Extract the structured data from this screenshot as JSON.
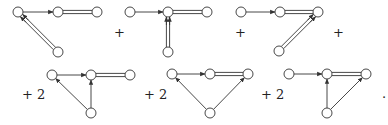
{
  "equation": {
    "operators": {
      "plus": "+",
      "plus_two": "+ 2",
      "terminator": "."
    },
    "diagrams": [
      {
        "id": "d1",
        "row": 1,
        "nodes": [
          [
            18,
            12
          ],
          [
            58,
            12
          ],
          [
            97,
            12
          ],
          [
            58,
            52
          ]
        ],
        "edges": [
          {
            "from": 0,
            "to": 1,
            "type": "arrow"
          },
          {
            "from": 1,
            "to": 2,
            "type": "double"
          },
          {
            "from": 3,
            "to": 0,
            "type": "double-arrow"
          }
        ]
      },
      {
        "id": "d2",
        "row": 1,
        "nodes": [
          [
            130,
            12
          ],
          [
            168,
            12
          ],
          [
            207,
            12
          ],
          [
            168,
            52
          ]
        ],
        "edges": [
          {
            "from": 0,
            "to": 1,
            "type": "arrow"
          },
          {
            "from": 1,
            "to": 2,
            "type": "double"
          },
          {
            "from": 3,
            "to": 1,
            "type": "double-arrow"
          }
        ]
      },
      {
        "id": "d3",
        "row": 1,
        "nodes": [
          [
            241,
            12
          ],
          [
            280,
            12
          ],
          [
            318,
            12
          ],
          [
            279,
            51
          ]
        ],
        "edges": [
          {
            "from": 0,
            "to": 1,
            "type": "arrow"
          },
          {
            "from": 1,
            "to": 2,
            "type": "double"
          },
          {
            "from": 3,
            "to": 2,
            "type": "double-arrow"
          }
        ]
      },
      {
        "id": "d4",
        "row": 2,
        "nodes": [
          [
            52,
            75
          ],
          [
            91,
            75
          ],
          [
            130,
            75
          ],
          [
            91,
            113
          ]
        ],
        "edges": [
          {
            "from": 0,
            "to": 1,
            "type": "arrow"
          },
          {
            "from": 1,
            "to": 2,
            "type": "double"
          },
          {
            "from": 3,
            "to": 0,
            "type": "arrow"
          },
          {
            "from": 3,
            "to": 1,
            "type": "arrow"
          }
        ]
      },
      {
        "id": "d5",
        "row": 2,
        "nodes": [
          [
            172,
            74
          ],
          [
            210,
            74
          ],
          [
            248,
            74
          ],
          [
            210,
            113
          ]
        ],
        "edges": [
          {
            "from": 0,
            "to": 1,
            "type": "arrow"
          },
          {
            "from": 1,
            "to": 2,
            "type": "double"
          },
          {
            "from": 3,
            "to": 0,
            "type": "arrow"
          },
          {
            "from": 3,
            "to": 2,
            "type": "arrow"
          }
        ]
      },
      {
        "id": "d6",
        "row": 2,
        "nodes": [
          [
            289,
            74
          ],
          [
            327,
            74
          ],
          [
            366,
            74
          ],
          [
            327,
            113
          ]
        ],
        "edges": [
          {
            "from": 0,
            "to": 1,
            "type": "arrow"
          },
          {
            "from": 1,
            "to": 2,
            "type": "double"
          },
          {
            "from": 3,
            "to": 1,
            "type": "arrow"
          },
          {
            "from": 3,
            "to": 2,
            "type": "arrow"
          }
        ]
      }
    ],
    "symbols": [
      {
        "text_key": "plus",
        "x": 114,
        "y": 37
      },
      {
        "text_key": "plus",
        "x": 235,
        "y": 37
      },
      {
        "text_key": "plus",
        "x": 333,
        "y": 37
      },
      {
        "text_key": "plus_two",
        "x": 22,
        "y": 99
      },
      {
        "text_key": "plus_two",
        "x": 144,
        "y": 99
      },
      {
        "text_key": "plus_two",
        "x": 261,
        "y": 99
      },
      {
        "text_key": "terminator",
        "x": 382,
        "y": 98
      }
    ]
  },
  "style": {
    "stroke": "#333333",
    "node_fill": "#ffffff",
    "node_radius": 5
  }
}
